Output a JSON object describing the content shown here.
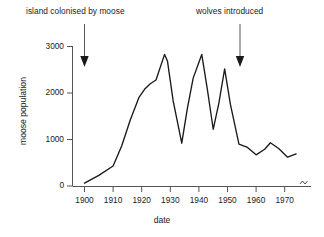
{
  "chart_data": {
    "type": "line",
    "title": "",
    "xlabel": "date",
    "ylabel": "moose population",
    "xlim": [
      1893,
      1976
    ],
    "ylim": [
      0,
      3000
    ],
    "grid": false,
    "legend": "none",
    "axis_break_right": true,
    "xticks": [
      1900,
      1910,
      1920,
      1930,
      1940,
      1950,
      1960,
      1970
    ],
    "xtick_labels": [
      "1900",
      "1910",
      "1920",
      "1930",
      "1940",
      "1950",
      "1960",
      "1970"
    ],
    "yticks": [
      0,
      1000,
      2000,
      3000
    ],
    "ytick_labels": [
      "0",
      "1000",
      "2000",
      "3000"
    ],
    "series": [
      {
        "name": "moose population",
        "color": "#1a1a1a",
        "x": [
          1900,
          1905,
          1910,
          1913,
          1916,
          1919,
          1921,
          1923,
          1925,
          1928,
          1929,
          1931,
          1934,
          1936,
          1938,
          1941,
          1943,
          1945,
          1947,
          1949,
          1951,
          1954,
          1957,
          1960,
          1963,
          1965,
          1968,
          1971,
          1974
        ],
        "y": [
          60,
          230,
          430,
          860,
          1420,
          1900,
          2080,
          2200,
          2280,
          2830,
          2690,
          1830,
          920,
          1680,
          2320,
          2830,
          2060,
          1220,
          1790,
          2520,
          1760,
          900,
          830,
          670,
          790,
          930,
          800,
          620,
          690
        ]
      }
    ],
    "annotations": [
      {
        "name": "island-colonised",
        "text": "island colonised by moose",
        "arrow_x": 1900,
        "arrow_from_y": 3200,
        "arrow_to_y": 2740
      },
      {
        "name": "wolves-introduced",
        "text": "wolves introduced",
        "arrow_x": 1949,
        "arrow_from_y": 3200,
        "arrow_to_y": 2740
      }
    ]
  },
  "axes": {
    "xlabel": "date",
    "ylabel": "moose population"
  },
  "annotations": {
    "left": "island colonised by moose",
    "right": "wolves introduced"
  },
  "ticks": {
    "x": [
      "1900",
      "1910",
      "1920",
      "1930",
      "1940",
      "1950",
      "1960",
      "1970"
    ],
    "y": [
      "3000",
      "2000",
      "1000",
      "0"
    ]
  },
  "colors": {
    "line": "#1a1a1a",
    "axis": "#555555",
    "text": "#1a1a1a",
    "background": "#ffffff"
  }
}
